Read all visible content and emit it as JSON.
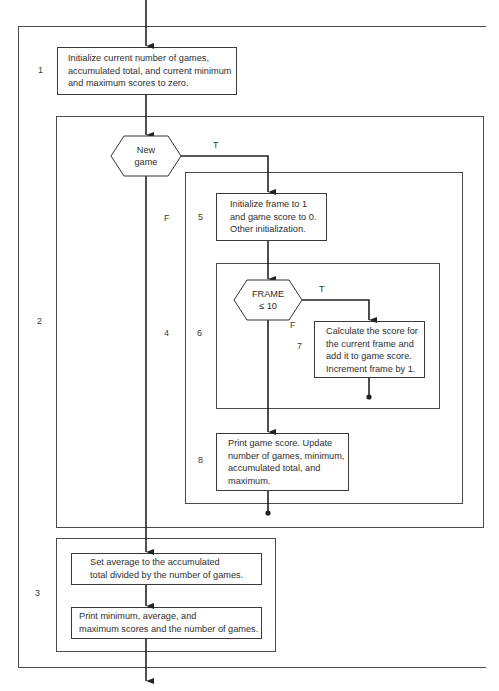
{
  "diagram": {
    "type": "structured flowchart",
    "step_labels": {
      "s1": "1",
      "s2": "2",
      "s3": "3",
      "s4": "4",
      "s5": "5",
      "s6": "6",
      "s7": "7",
      "s8": "8"
    },
    "boxes": {
      "init_games": "Initialize current number of games,\naccumulated total, and current minimum\nand maximum scores to zero.",
      "init_frame": "Initialize frame to 1\nand game score to 0.\nOther initialization.",
      "calc_score": "Calculate the score for\nthe current frame and\nadd it to game score.\nIncrement frame by 1.",
      "print_game": "Print game score. Update\nnumber of games, minimum,\naccumulated total, and\nmaximum.",
      "set_average": "Set average to the accumulated\ntotal divided by the number of games.",
      "print_summary": "Print minimum, average, and\nmaximum scores and the number of games."
    },
    "decisions": {
      "new_game": "New\ngame",
      "frame_check": "FRAME\n≤ 10"
    },
    "branch_labels": {
      "new_game_true": "T",
      "new_game_false": "F",
      "frame_true": "T",
      "frame_false": "F"
    },
    "colors": {
      "line": "#2a2a2a",
      "frame": "#4a4a4a",
      "background": "#ffffff"
    }
  }
}
